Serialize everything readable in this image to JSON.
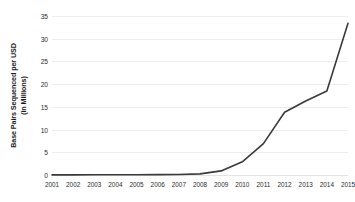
{
  "chart_data": {
    "type": "line",
    "title": "",
    "subtitle": "",
    "xlabel": "",
    "ylabel": "Base Pairs Sequenced per USD (in Millions)",
    "ylabel_line1": "Base Pairs Sequenced per USD",
    "ylabel_line2": "(in Millions)",
    "categories": [
      "2001",
      "2002",
      "2003",
      "2004",
      "2005",
      "2006",
      "2007",
      "2008",
      "2009",
      "2010",
      "2011",
      "2012",
      "2013",
      "2014",
      "2015"
    ],
    "values": [
      0.02,
      0.03,
      0.04,
      0.05,
      0.06,
      0.08,
      0.1,
      0.25,
      0.9,
      2.9,
      6.9,
      13.8,
      16.3,
      18.5,
      33.4
    ],
    "series": [
      {
        "name": "Base pairs sequenced per USD",
        "color": "#3a3a3a",
        "values": [
          0.02,
          0.03,
          0.04,
          0.05,
          0.06,
          0.08,
          0.1,
          0.25,
          0.9,
          2.9,
          6.9,
          13.8,
          16.3,
          18.5,
          33.4
        ]
      }
    ],
    "yticks": [
      0,
      5,
      10,
      15,
      20,
      25,
      30,
      35
    ],
    "ylim": [
      0,
      35
    ],
    "grid": "horizontal",
    "legend": "none",
    "gridline_color": "#ededed",
    "line_color": "#3a3a3a",
    "background_color": "#ffffff",
    "text_color": "#2b2b2b"
  }
}
